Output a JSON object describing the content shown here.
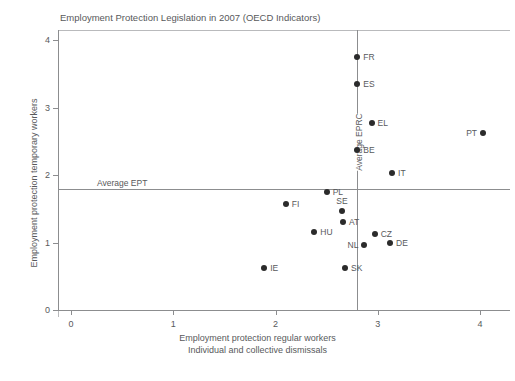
{
  "chart_data": {
    "type": "scatter",
    "title": "Employment Protection Legislation in 2007 (OECD Indicators)",
    "xlabel_line1": "Employment protection regular workers",
    "xlabel_line2": "Individual and collective dismissals",
    "ylabel": "Employment protection temporary workers",
    "xlim": [
      0,
      4
    ],
    "ylim": [
      0,
      4
    ],
    "xticks": [
      "0",
      "1",
      "2",
      "3",
      "4"
    ],
    "xtick_values": [
      0,
      1,
      2,
      3,
      4
    ],
    "yticks": [
      "0",
      "1",
      "2",
      "3",
      "4"
    ],
    "ytick_values": [
      0,
      1,
      2,
      3,
      4
    ],
    "grid": false,
    "legend": "none",
    "marker_color": "#2b2b2b",
    "axis_color": "#8c8d8f",
    "reference_lines": [
      {
        "orientation": "horizontal",
        "label": "Average EPT",
        "value": 1.8
      },
      {
        "orientation": "vertical",
        "label": "Average EPRC",
        "value": 2.8
      }
    ],
    "points": [
      {
        "label": "FR",
        "x": 2.8,
        "y": 3.75,
        "label_pos": "right"
      },
      {
        "label": "ES",
        "x": 2.8,
        "y": 3.35,
        "label_pos": "right"
      },
      {
        "label": "EL",
        "x": 2.94,
        "y": 2.77,
        "label_pos": "right"
      },
      {
        "label": "PT",
        "x": 4.03,
        "y": 2.62,
        "label_pos": "left"
      },
      {
        "label": "BE",
        "x": 2.8,
        "y": 2.37,
        "label_pos": "right"
      },
      {
        "label": "IT",
        "x": 3.14,
        "y": 2.03,
        "label_pos": "right"
      },
      {
        "label": "PL",
        "x": 2.5,
        "y": 1.75,
        "label_pos": "right"
      },
      {
        "label": "FI",
        "x": 2.1,
        "y": 1.57,
        "label_pos": "right"
      },
      {
        "label": "SE",
        "x": 2.65,
        "y": 1.47,
        "label_pos": "above"
      },
      {
        "label": "AT",
        "x": 2.66,
        "y": 1.3,
        "label_pos": "right"
      },
      {
        "label": "HU",
        "x": 2.38,
        "y": 1.16,
        "label_pos": "right"
      },
      {
        "label": "CZ",
        "x": 2.97,
        "y": 1.13,
        "label_pos": "right"
      },
      {
        "label": "DE",
        "x": 3.12,
        "y": 0.99,
        "label_pos": "right"
      },
      {
        "label": "NL",
        "x": 2.87,
        "y": 0.96,
        "label_pos": "left"
      },
      {
        "label": "IE",
        "x": 1.89,
        "y": 0.62,
        "label_pos": "right"
      },
      {
        "label": "SK",
        "x": 2.68,
        "y": 0.62,
        "label_pos": "right"
      }
    ]
  }
}
